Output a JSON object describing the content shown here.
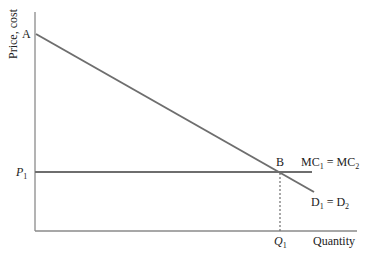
{
  "diagram": {
    "type": "economics-price-quantity",
    "colors": {
      "axis": "#8a8a8a",
      "curve": "#6e6e6e",
      "text": "#222222",
      "dashed": "#6e6e6e"
    },
    "axes": {
      "y_label": "Price, cost",
      "x_label": "Quantity"
    },
    "points": {
      "A": "A",
      "B": "B"
    },
    "ticks": {
      "price_label": "P",
      "price_sub": "1",
      "quantity_label": "Q",
      "quantity_sub": "1"
    },
    "curves": {
      "mc": {
        "label_main": "MC",
        "sub1": "1",
        "eq": " = MC",
        "sub2": "2"
      },
      "demand": {
        "label_main": "D",
        "sub1": "1",
        "eq": " = D",
        "sub2": "2"
      }
    }
  }
}
